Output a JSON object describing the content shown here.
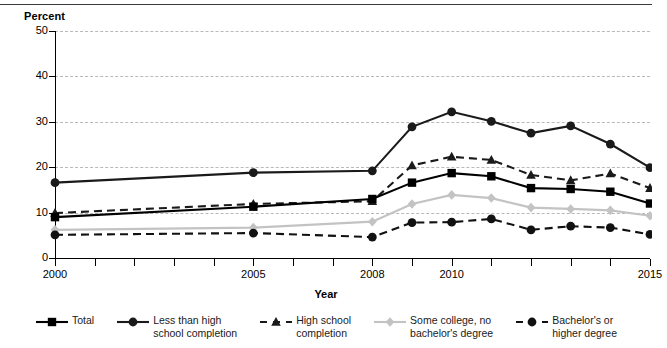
{
  "chart_data": {
    "type": "line",
    "title": "",
    "subtitle": "",
    "xlabel": "Year",
    "ylabel": "Percent",
    "ylim": [
      0,
      50
    ],
    "yticks": [
      0,
      10,
      20,
      30,
      40,
      50
    ],
    "xlim": [
      2000,
      2015
    ],
    "xticks": [
      2000,
      2001,
      2002,
      2003,
      2004,
      2005,
      2006,
      2007,
      2008,
      2009,
      2010,
      2011,
      2012,
      2013,
      2014,
      2015
    ],
    "xtick_labels": [
      "2000",
      "2005",
      "2008",
      "2010",
      "2015"
    ],
    "xtick_label_years": [
      2000,
      2005,
      2008,
      2010,
      2015
    ],
    "grid": "horizontal-dashed",
    "legend_position": "bottom",
    "x": [
      2000,
      2005,
      2008,
      2009,
      2010,
      2011,
      2012,
      2013,
      2014,
      2015
    ],
    "series": [
      {
        "name": "Total",
        "marker": "square",
        "line": "solid",
        "color": "#000000",
        "values": [
          9.0,
          11.3,
          13.0,
          16.6,
          18.7,
          18.0,
          15.4,
          15.2,
          14.6,
          12.0
        ]
      },
      {
        "name": "Less than high school completion",
        "marker": "circle",
        "line": "solid",
        "color": "#1a1a1a",
        "values": [
          16.6,
          18.8,
          19.2,
          28.9,
          32.2,
          30.1,
          27.5,
          29.1,
          25.1,
          19.9
        ]
      },
      {
        "name": "High school completion",
        "marker": "triangle",
        "line": "dashed",
        "color": "#1a1a1a",
        "values": [
          9.9,
          11.9,
          12.5,
          20.4,
          22.3,
          21.6,
          18.3,
          17.1,
          18.6,
          15.4
        ]
      },
      {
        "name": "Some college, no bachelor's degree",
        "marker": "diamond",
        "line": "solid",
        "color": "#c3c3c3",
        "values": [
          6.2,
          6.7,
          8.0,
          11.9,
          13.9,
          13.2,
          11.1,
          10.8,
          10.5,
          9.3
        ]
      },
      {
        "name": "Bachelor's or higher degree",
        "marker": "circle",
        "line": "dashed",
        "color": "#111111",
        "values": [
          5.1,
          5.5,
          4.6,
          7.8,
          7.9,
          8.6,
          6.2,
          7.0,
          6.7,
          5.2
        ]
      }
    ]
  },
  "axis": {
    "y_title": "Percent",
    "x_title": "Year"
  },
  "legend": {
    "items": [
      {
        "label": "Total"
      },
      {
        "label": "Less than high\nschool completion"
      },
      {
        "label": "High school\ncompletion"
      },
      {
        "label": "Some college, no\nbachelor's degree"
      },
      {
        "label": "Bachelor's or\nhigher degree"
      }
    ]
  },
  "colors": {
    "grid": "#b9b9b9",
    "axis": "#000000",
    "series_dark": "#000000",
    "series_light": "#c3c3c3"
  }
}
